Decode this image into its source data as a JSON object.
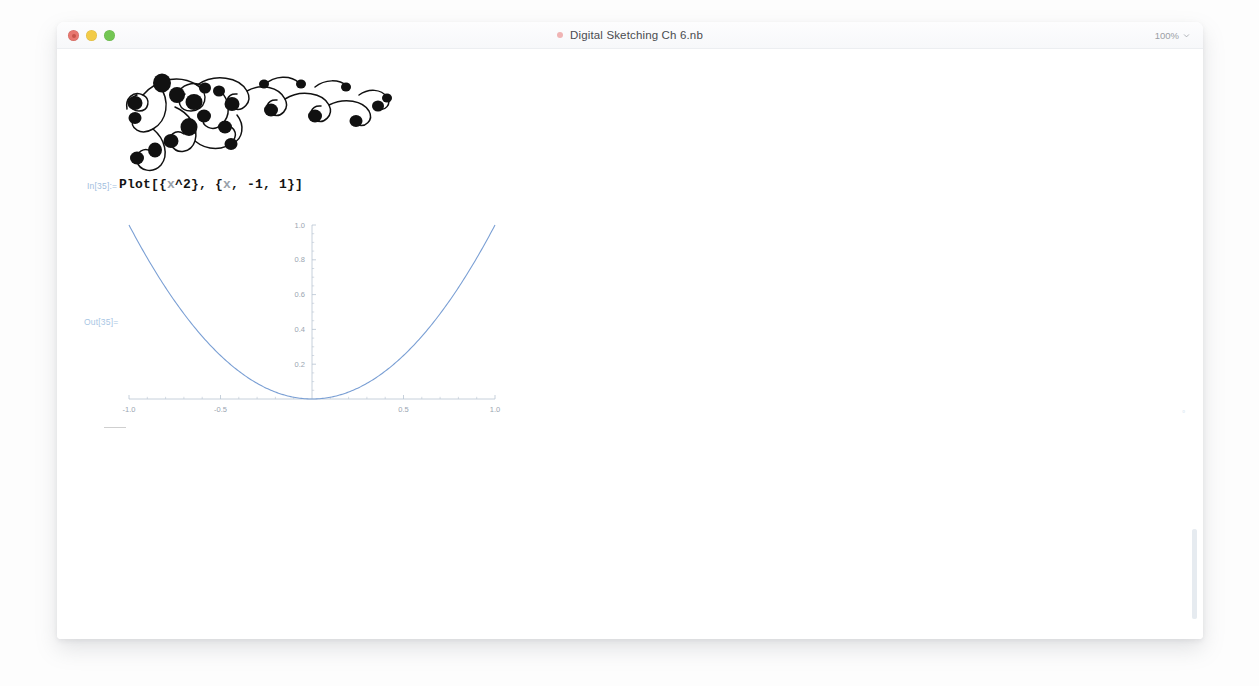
{
  "window": {
    "title": "Digital Sketching Ch 6.nb",
    "title_dot": "unsaved-dot",
    "zoom_level": "100%",
    "traffic_lights": [
      {
        "name": "close",
        "color": "#e8776f"
      },
      {
        "name": "minimize",
        "color": "#f2cb48"
      },
      {
        "name": "maximize",
        "color": "#73c653"
      }
    ]
  },
  "notebook": {
    "decoration": {
      "name": "ornamental-swirl-sketch",
      "description": "hand-drawn black floral swirl flourish"
    },
    "input_cell": {
      "label": "In[35]:=",
      "code_plain": "Plot[{x^2}, {x, -1, 1}]",
      "tokens": {
        "fn": "Plot",
        "open": "[{",
        "var1": "x",
        "pow": "^2",
        "mid": "}, {",
        "var2": "x",
        "args": ", -1, 1}]"
      }
    },
    "output_cell": {
      "label": "Out[35]="
    },
    "cell_bracket": "cell-group-bar",
    "side_marker": "▫"
  },
  "chart_data": {
    "type": "line",
    "title": "",
    "subtitle": "",
    "xlabel": "",
    "ylabel": "",
    "expression": "x^2",
    "xlim": [
      -1.0,
      1.0
    ],
    "ylim": [
      0.0,
      1.0
    ],
    "grid": false,
    "legend": "none",
    "axis_origin": [
      0,
      0
    ],
    "xticks": [
      -1.0,
      -0.5,
      0.5,
      1.0
    ],
    "xtick_labels": [
      "-1.0",
      "-0.5",
      "0.5",
      "1.0"
    ],
    "yticks": [
      0.2,
      0.4,
      0.6,
      0.8,
      1.0
    ],
    "ytick_labels": [
      "0.2",
      "0.4",
      "0.6",
      "0.8",
      "1.0"
    ],
    "line_color": "#7a9fd4",
    "series": [
      {
        "name": "x^2",
        "x": [
          -1.0,
          -0.9,
          -0.8,
          -0.7,
          -0.6,
          -0.5,
          -0.4,
          -0.3,
          -0.2,
          -0.1,
          0.0,
          0.1,
          0.2,
          0.3,
          0.4,
          0.5,
          0.6,
          0.7,
          0.8,
          0.9,
          1.0
        ],
        "values": [
          1.0,
          0.81,
          0.64,
          0.49,
          0.36,
          0.25,
          0.16,
          0.09,
          0.04,
          0.01,
          0.0,
          0.01,
          0.04,
          0.09,
          0.16,
          0.25,
          0.36,
          0.49,
          0.64,
          0.81,
          1.0
        ]
      }
    ]
  }
}
